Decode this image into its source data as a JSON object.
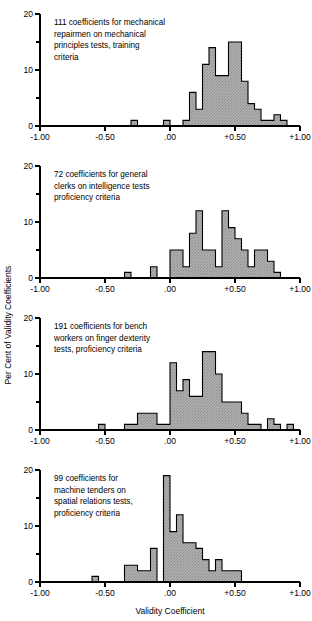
{
  "figure": {
    "width": 312,
    "height": 621,
    "background": "#ffffff",
    "ink_color": "#000000",
    "bar_fill_color": "#a9a9a9"
  },
  "axes": {
    "y_label": "Per Cent of Validity Coefficients",
    "x_label": "Validity Coefficient",
    "x_tick_labels": [
      "-1.00",
      "-0.50",
      ".00",
      "+0.50",
      "+1.00"
    ],
    "x_tick_values": [
      -1.0,
      -0.5,
      0.0,
      0.5,
      1.0
    ],
    "y_tick_labels": [
      "0",
      "10",
      "20"
    ],
    "y_tick_values": [
      0,
      10,
      20
    ],
    "y_minor_ticks": [
      5,
      15
    ],
    "xlim": [
      -1.0,
      1.0
    ],
    "ylim": [
      0,
      20
    ]
  },
  "chart_data": {
    "type": "bar",
    "title": "",
    "xlabel": "Validity Coefficient",
    "ylabel": "Per Cent of Validity Coefficients",
    "xlim": [
      -1.0,
      1.0
    ],
    "ylim": [
      0,
      20
    ],
    "grid": false,
    "legend": "none",
    "bin_width": 0.05,
    "panels": [
      {
        "id": "panel-1",
        "caption": "111 coefficients for mechanical repairmen on mechanical principles tests, training criteria",
        "caption_lines": [
          "111 coefficients for mechanical",
          "repairmen on mechanical",
          "principles tests, training",
          "criteria"
        ],
        "n_coefficients": 111,
        "bin_left_edges": [
          -1.0,
          -0.95,
          -0.9,
          -0.85,
          -0.8,
          -0.75,
          -0.7,
          -0.65,
          -0.6,
          -0.55,
          -0.5,
          -0.45,
          -0.4,
          -0.35,
          -0.3,
          -0.25,
          -0.2,
          -0.15,
          -0.1,
          -0.05,
          0.0,
          0.05,
          0.1,
          0.15,
          0.2,
          0.25,
          0.3,
          0.35,
          0.4,
          0.45,
          0.5,
          0.55,
          0.6,
          0.65,
          0.7,
          0.75,
          0.8,
          0.85,
          0.9,
          0.95
        ],
        "values": [
          0,
          0,
          0,
          0,
          0,
          0,
          0,
          0,
          0,
          0,
          0,
          0,
          0,
          0,
          1,
          0,
          0,
          0,
          0,
          1,
          0,
          0,
          1,
          6,
          3,
          11,
          14,
          9,
          9,
          15,
          15,
          8,
          4,
          3,
          1,
          1,
          2,
          1,
          0,
          0
        ]
      },
      {
        "id": "panel-2",
        "caption": "72 coefficients for general clerks on intelligence tests proficiency criteria",
        "caption_lines": [
          "72 coefficients for general",
          "clerks on intelligence tests",
          "proficiency criteria"
        ],
        "n_coefficients": 72,
        "bin_left_edges": [
          -1.0,
          -0.95,
          -0.9,
          -0.85,
          -0.8,
          -0.75,
          -0.7,
          -0.65,
          -0.6,
          -0.55,
          -0.5,
          -0.45,
          -0.4,
          -0.35,
          -0.3,
          -0.25,
          -0.2,
          -0.15,
          -0.1,
          -0.05,
          0.0,
          0.05,
          0.1,
          0.15,
          0.2,
          0.25,
          0.3,
          0.35,
          0.4,
          0.45,
          0.5,
          0.55,
          0.6,
          0.65,
          0.7,
          0.75,
          0.8,
          0.85,
          0.9,
          0.95
        ],
        "values": [
          0,
          0,
          0,
          0,
          0,
          0,
          0,
          0,
          0,
          0,
          0,
          0,
          0,
          1,
          0,
          0,
          0,
          2,
          0,
          0,
          5,
          5,
          2,
          8,
          12,
          5,
          5,
          2,
          12,
          9,
          7,
          5,
          2,
          5,
          5,
          3,
          1,
          0,
          0,
          0
        ]
      },
      {
        "id": "panel-3",
        "caption": "191 coefficients for bench workers on finger dexterity tests, proficiency criteria",
        "caption_lines": [
          "191 coefficients for bench",
          "workers on finger dexterity",
          "tests, proficiency criteria"
        ],
        "n_coefficients": 191,
        "bin_left_edges": [
          -1.0,
          -0.95,
          -0.9,
          -0.85,
          -0.8,
          -0.75,
          -0.7,
          -0.65,
          -0.6,
          -0.55,
          -0.5,
          -0.45,
          -0.4,
          -0.35,
          -0.3,
          -0.25,
          -0.2,
          -0.15,
          -0.1,
          -0.05,
          0.0,
          0.05,
          0.1,
          0.15,
          0.2,
          0.25,
          0.3,
          0.35,
          0.4,
          0.45,
          0.5,
          0.55,
          0.6,
          0.65,
          0.7,
          0.75,
          0.8,
          0.85,
          0.9,
          0.95
        ],
        "values": [
          0,
          0,
          0,
          0,
          0,
          0,
          0,
          0,
          0,
          1,
          0,
          0,
          0,
          1,
          1,
          3,
          3,
          3,
          1,
          1,
          12,
          7,
          9,
          6,
          6,
          14,
          14,
          10,
          5,
          5,
          5,
          3,
          1,
          1,
          0,
          2,
          1,
          0,
          1,
          0
        ]
      },
      {
        "id": "panel-4",
        "caption": "99 coefficients for machine tenders on spatial relations tests, proficiency criteria",
        "caption_lines": [
          "99 coefficients for",
          "machine tenders on",
          "spatial relations tests,",
          "proficiency criteria"
        ],
        "n_coefficients": 99,
        "bin_left_edges": [
          -1.0,
          -0.95,
          -0.9,
          -0.85,
          -0.8,
          -0.75,
          -0.7,
          -0.65,
          -0.6,
          -0.55,
          -0.5,
          -0.45,
          -0.4,
          -0.35,
          -0.3,
          -0.25,
          -0.2,
          -0.15,
          -0.1,
          -0.05,
          0.0,
          0.05,
          0.1,
          0.15,
          0.2,
          0.25,
          0.3,
          0.35,
          0.4,
          0.45,
          0.5,
          0.55,
          0.6,
          0.65,
          0.7,
          0.75,
          0.8,
          0.85,
          0.9,
          0.95
        ],
        "values": [
          0,
          0,
          0,
          0,
          0,
          0,
          0,
          0,
          1,
          0,
          0,
          0,
          0,
          3,
          3,
          2,
          2,
          6,
          0,
          19,
          9,
          12,
          7,
          7,
          6,
          4,
          2,
          4,
          2,
          2,
          2,
          0,
          0,
          0,
          0,
          0,
          0,
          0,
          0,
          0
        ]
      }
    ]
  }
}
